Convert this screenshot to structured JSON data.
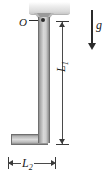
{
  "figure": {
    "type": "physics-free-body-diagram",
    "background_color": "#ffffff"
  },
  "labels": {
    "pivot": "O",
    "vertical_length": "L",
    "vertical_length_sub": "1",
    "horizontal_length": "L",
    "horizontal_length_sub": "2",
    "gravity": "g"
  },
  "elements": {
    "ceiling_mount": "ceiling-support-block",
    "bracket": "pivot-bracket-triangle",
    "pivot_point": "pivot-dot",
    "bar_vertical": "l-bar-vertical-limb",
    "bar_horizontal": "l-bar-horizontal-limb",
    "gravity_arrow": "gravity-vector-arrow",
    "dimension_vertical": "dimension-line-L1",
    "dimension_horizontal": "dimension-line-L2"
  },
  "colors": {
    "bar_fill": "#d8d8d8",
    "bar_edge": "#6f6f6f",
    "ceiling_fill": "#e4e4e4",
    "bracket_fill": "#b8b8b8",
    "ink": "#1a1a1a",
    "dimension_line": "#3a3a3a"
  }
}
